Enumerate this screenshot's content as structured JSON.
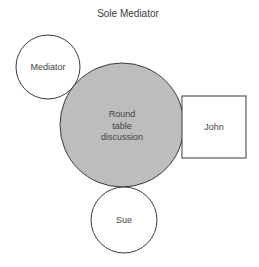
{
  "diagram": {
    "title": "Sole Mediator",
    "colors": {
      "stroke": "#3a3a3a",
      "center_fill": "#bdbdbd",
      "node_fill": "#ffffff",
      "text": "#444444"
    },
    "center": {
      "shape": "circle",
      "label_lines": [
        "Round",
        "table",
        "discussion"
      ],
      "cx": 122,
      "cy": 125,
      "r": 62
    },
    "nodes": [
      {
        "id": "mediator",
        "shape": "circle",
        "label": "Mediator",
        "cx": 48,
        "cy": 67,
        "r": 32
      },
      {
        "id": "john",
        "shape": "rect",
        "label": "John",
        "x": 182,
        "y": 96,
        "width": 64,
        "height": 62
      },
      {
        "id": "sue",
        "shape": "circle",
        "label": "Sue",
        "cx": 124,
        "cy": 220,
        "r": 33
      }
    ]
  }
}
